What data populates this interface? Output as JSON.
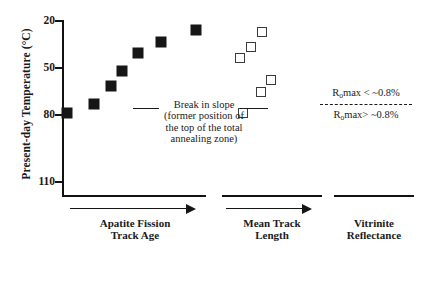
{
  "chart_data": {
    "type": "scatter",
    "title": "",
    "ylabel": "Present-day Temperature (°C)",
    "xlabel": "",
    "ylim": [
      20,
      118
    ],
    "y_inverted": true,
    "yticks": [
      20,
      50,
      80,
      110
    ],
    "ytick_labels": [
      "20",
      "50",
      "80",
      "110"
    ],
    "grid": false,
    "x_axis_groups": [
      {
        "label_line1": "Apatite Fission",
        "label_line2": "Track Age",
        "has_arrow": true
      },
      {
        "label_line1": "Mean Track",
        "label_line2": "Length",
        "has_arrow": true
      },
      {
        "label_line1": "Vitrinite",
        "label_line2": "Reflectance",
        "has_arrow": false
      }
    ],
    "series": [
      {
        "name": "Apatite Fission Track Age",
        "marker": "filled-square",
        "color": "#161616",
        "points": [
          {
            "x": 67,
            "y": 113
          },
          {
            "x": 94,
            "y": 104
          },
          {
            "x": 111,
            "y": 86
          },
          {
            "x": 122,
            "y": 71
          },
          {
            "x": 138,
            "y": 53
          },
          {
            "x": 161,
            "y": 42
          },
          {
            "x": 196,
            "y": 30
          }
        ]
      },
      {
        "name": "Mean Track Length",
        "marker": "open-square",
        "color": "#3a3a3a",
        "points": [
          {
            "x": 243,
            "y": 113
          },
          {
            "x": 261,
            "y": 92
          },
          {
            "x": 271,
            "y": 80
          },
          {
            "x": 240,
            "y": 58
          },
          {
            "x": 251,
            "y": 47
          },
          {
            "x": 262,
            "y": 32
          }
        ]
      }
    ],
    "annotations": [
      {
        "name": "break-in-slope",
        "text_lines": [
          "Break in slope",
          "(former position of",
          "the top of the total",
          "annealing zone)"
        ],
        "temperature": 80,
        "has_leader_lines": true
      }
    ],
    "legend": {
      "position": "right",
      "entries": [
        {
          "label_html": "R<sub>o</sub>max < ~0.8%",
          "label_text": "Romax < ~0.8%"
        },
        {
          "label_html": "R<sub>o</sub>max> ~0.8%",
          "label_text": "Romax> ~0.8%"
        }
      ],
      "divider": "dashed"
    }
  },
  "axis": {
    "ylabel": "Present-day Temperature (°C)",
    "ticks": [
      {
        "label": "20",
        "top": 20
      },
      {
        "label": "50",
        "top": 67
      },
      {
        "label": "80",
        "top": 114
      },
      {
        "label": "110",
        "top": 181
      }
    ]
  },
  "annotation": {
    "line1": "Break in slope",
    "line2": "(former position of",
    "line3": "the top of the total",
    "line4": "annealing zone)"
  },
  "legend": {
    "entry_above_prefix": "R",
    "entry_above_sub": "o",
    "entry_above_suffix": "max < ~0.8%",
    "entry_below_prefix": "R",
    "entry_below_sub": "o",
    "entry_below_suffix": "max> ~0.8%"
  },
  "xgroups": {
    "aft_line1": "Apatite Fission",
    "aft_line2": "Track Age",
    "mtl_line1": "Mean Track",
    "mtl_line2": "Length",
    "vr_line1": "Vitrinite",
    "vr_line2": "Reflectance"
  }
}
